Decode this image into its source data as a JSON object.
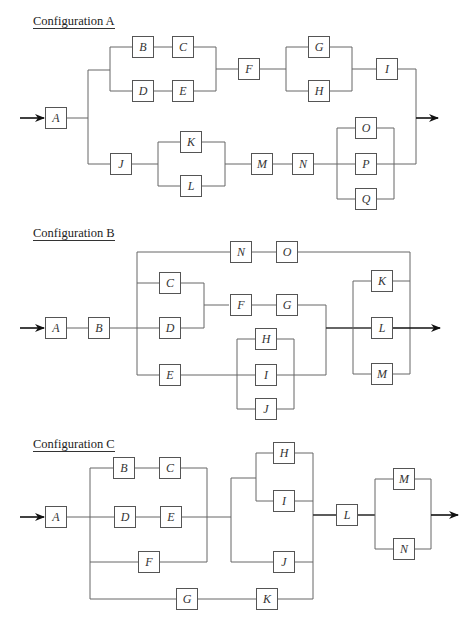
{
  "configs": {
    "a": {
      "title": "Configuration A",
      "blocks": {
        "A": "A",
        "B": "B",
        "C": "C",
        "D": "D",
        "E": "E",
        "F": "F",
        "G": "G",
        "H": "H",
        "I": "I",
        "J": "J",
        "K": "K",
        "L": "L",
        "M": "M",
        "N": "N",
        "O": "O",
        "P": "P",
        "Q": "Q"
      }
    },
    "b": {
      "title": "Configuration B",
      "blocks": {
        "A": "A",
        "B": "B",
        "C": "C",
        "D": "D",
        "E": "E",
        "F": "F",
        "G": "G",
        "H": "H",
        "I": "I",
        "J": "J",
        "K": "K",
        "L": "L",
        "M": "M",
        "N": "N",
        "O": "O"
      }
    },
    "c": {
      "title": "Configuration C",
      "blocks": {
        "A": "A",
        "B": "B",
        "C": "C",
        "D": "D",
        "E": "E",
        "F": "F",
        "G": "G",
        "H": "H",
        "I": "I",
        "J": "J",
        "K": "K",
        "L": "L",
        "M": "M",
        "N": "N"
      }
    }
  },
  "colors": {
    "line": "#666666",
    "box_border": "#555555",
    "arrow": "#111111",
    "text": "#333333"
  }
}
